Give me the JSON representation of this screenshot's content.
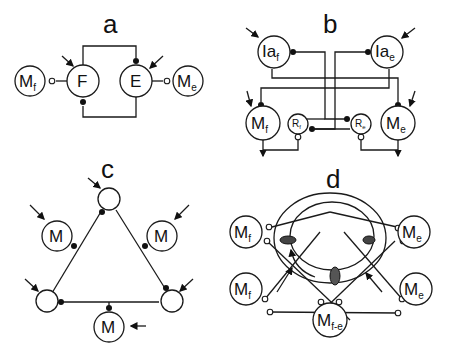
{
  "figure": {
    "panels": {
      "a": {
        "label": "a",
        "nodes": {
          "mf": {
            "main": "M",
            "sub": "f"
          },
          "f": {
            "main": "F"
          },
          "e": {
            "main": "E"
          },
          "me": {
            "main": "M",
            "sub": "e"
          }
        }
      },
      "b": {
        "label": "b",
        "nodes": {
          "iaf": {
            "main": "Ia",
            "sub": "f"
          },
          "iae": {
            "main": "Ia",
            "sub": "e"
          },
          "mf": {
            "main": "M",
            "sub": "f"
          },
          "me": {
            "main": "M",
            "sub": "e"
          },
          "rf": {
            "main": "R",
            "sub": "f"
          },
          "re": {
            "main": "R",
            "sub": "e"
          }
        }
      },
      "c": {
        "label": "c",
        "nodes": {
          "m_left": {
            "main": "M"
          },
          "m_right": {
            "main": "M"
          },
          "m_bottom": {
            "main": "M"
          }
        }
      },
      "d": {
        "label": "d",
        "nodes": {
          "mf_top": {
            "main": "M",
            "sub": "f"
          },
          "mf_bottom": {
            "main": "M",
            "sub": "f"
          },
          "me_top": {
            "main": "M",
            "sub": "e"
          },
          "me_bottom": {
            "main": "M",
            "sub": "e"
          },
          "mfe": {
            "main": "M",
            "sub": "f-e"
          }
        }
      }
    }
  }
}
